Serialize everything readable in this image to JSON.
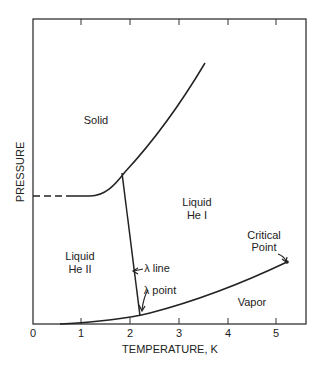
{
  "xlabel": "TEMPERATURE, K",
  "ylabel": "PRESSURE",
  "x_ticks": [
    "0",
    "1",
    "2",
    "3",
    "4",
    "5"
  ],
  "regions": {
    "solid": "Solid",
    "liquid_he1_a": "Liquid",
    "liquid_he1_b": "He I",
    "liquid_he2_a": "Liquid",
    "liquid_he2_b": "He II",
    "vapor": "Vapor"
  },
  "annotations": {
    "lambda_line": "λ line",
    "lambda_point": "λ point",
    "critical_a": "Critical",
    "critical_b": "Point"
  }
}
